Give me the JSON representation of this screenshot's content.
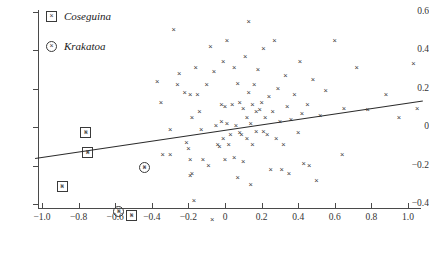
{
  "chart_data": {
    "type": "scatter",
    "title": "",
    "xlabel": "",
    "ylabel": "",
    "xlim": [
      -1.0,
      1.0
    ],
    "ylim": [
      -0.5,
      0.6
    ],
    "grid": false,
    "legend_position": "top-left",
    "xticks": [
      "−1.0",
      "−0.8",
      "−0.6",
      "−0.4",
      "−0.2",
      "0",
      "0.2",
      "0.4",
      "0.6",
      "0.8",
      "1.0"
    ],
    "xtick_values": [
      -1.0,
      -0.8,
      -0.6,
      -0.4,
      -0.2,
      0,
      0.2,
      0.4,
      0.6,
      0.8,
      1.0
    ],
    "yticks": [
      "0.6",
      "0.4",
      "0.2",
      "0",
      "−0.2",
      "−0.4"
    ],
    "ytick_values": [
      0.6,
      0.4,
      0.2,
      0,
      -0.2,
      -0.4
    ],
    "legend": [
      {
        "label": "Coseguina",
        "marker": "boxed-cross"
      },
      {
        "label": "Krakatoa",
        "marker": "circled-cross"
      }
    ],
    "series": [
      {
        "name": "observations",
        "marker": "cross",
        "points": [
          [
            -0.76,
            -0.03
          ],
          [
            -0.75,
            -0.13
          ],
          [
            -0.89,
            -0.31
          ],
          [
            -0.58,
            -0.44
          ],
          [
            -0.51,
            -0.46
          ],
          [
            -0.44,
            -0.21
          ],
          [
            -0.37,
            0.24
          ],
          [
            -0.35,
            0.13
          ],
          [
            -0.34,
            -0.14
          ],
          [
            -0.3,
            -0.14
          ],
          [
            -0.3,
            -0.01
          ],
          [
            -0.28,
            0.51
          ],
          [
            -0.26,
            0.22
          ],
          [
            -0.25,
            0.28
          ],
          [
            -0.22,
            0.18
          ],
          [
            -0.21,
            -0.08
          ],
          [
            -0.2,
            -0.11
          ],
          [
            -0.19,
            0.17
          ],
          [
            -0.19,
            -0.17
          ],
          [
            -0.19,
            -0.25
          ],
          [
            -0.18,
            0.05
          ],
          [
            -0.18,
            -0.24
          ],
          [
            -0.17,
            -0.38
          ],
          [
            -0.16,
            0.31
          ],
          [
            -0.15,
            0.17
          ],
          [
            -0.14,
            0.08
          ],
          [
            -0.13,
            -0.01
          ],
          [
            -0.12,
            -0.17
          ],
          [
            -0.1,
            0.22
          ],
          [
            -0.09,
            -0.2
          ],
          [
            -0.08,
            0.42
          ],
          [
            -0.07,
            -0.48
          ],
          [
            -0.06,
            0.29
          ],
          [
            -0.05,
            0.01
          ],
          [
            -0.04,
            -0.09
          ],
          [
            -0.03,
            -0.1
          ],
          [
            -0.02,
            0.12
          ],
          [
            -0.02,
            0.03
          ],
          [
            -0.01,
            -0.06
          ],
          [
            -0.01,
            0.34
          ],
          [
            0.0,
            0.11
          ],
          [
            0.0,
            -0.17
          ],
          [
            0.01,
            0.02
          ],
          [
            0.01,
            0.45
          ],
          [
            0.02,
            -0.09
          ],
          [
            0.03,
            -0.04
          ],
          [
            0.04,
            0.12
          ],
          [
            0.05,
            0.31
          ],
          [
            0.05,
            -0.16
          ],
          [
            0.06,
            0.01
          ],
          [
            0.07,
            0.23
          ],
          [
            0.07,
            -0.26
          ],
          [
            0.08,
            0.13
          ],
          [
            0.08,
            -0.03
          ],
          [
            0.09,
            -0.04
          ],
          [
            0.1,
            0.1
          ],
          [
            0.1,
            -0.18
          ],
          [
            0.11,
            0.37
          ],
          [
            0.12,
            0.05
          ],
          [
            0.12,
            -0.06
          ],
          [
            0.13,
            0.18
          ],
          [
            0.13,
            0.55
          ],
          [
            0.14,
            0.02
          ],
          [
            0.14,
            -0.3
          ],
          [
            0.15,
            0.12
          ],
          [
            0.15,
            -0.09
          ],
          [
            0.16,
            0.22
          ],
          [
            0.17,
            0.08
          ],
          [
            0.17,
            -0.02
          ],
          [
            0.18,
            0.3
          ],
          [
            0.19,
            0.09
          ],
          [
            0.2,
            0.13
          ],
          [
            0.21,
            -0.02
          ],
          [
            0.21,
            0.41
          ],
          [
            0.22,
            0.05
          ],
          [
            0.23,
            -0.04
          ],
          [
            0.24,
            0.16
          ],
          [
            0.25,
            -0.22
          ],
          [
            0.26,
            0.08
          ],
          [
            0.27,
            0.45
          ],
          [
            0.28,
            -0.06
          ],
          [
            0.29,
            0.2
          ],
          [
            0.3,
            0.03
          ],
          [
            0.31,
            -0.22
          ],
          [
            0.32,
            -0.09
          ],
          [
            0.33,
            0.27
          ],
          [
            0.34,
            0.11
          ],
          [
            0.35,
            -0.24
          ],
          [
            0.36,
            0.04
          ],
          [
            0.38,
            0.17
          ],
          [
            0.4,
            -0.03
          ],
          [
            0.41,
            0.34
          ],
          [
            0.42,
            0.07
          ],
          [
            0.43,
            -0.19
          ],
          [
            0.45,
            0.12
          ],
          [
            0.46,
            -0.2
          ],
          [
            0.48,
            0.25
          ],
          [
            0.5,
            -0.28
          ],
          [
            0.52,
            0.06
          ],
          [
            0.55,
            0.19
          ],
          [
            0.6,
            0.45
          ],
          [
            0.64,
            -0.14
          ],
          [
            0.65,
            0.1
          ],
          [
            0.72,
            0.31
          ],
          [
            0.78,
            0.09
          ],
          [
            0.88,
            0.17
          ],
          [
            0.95,
            0.05
          ],
          [
            1.03,
            0.33
          ],
          [
            1.05,
            0.1
          ]
        ]
      },
      {
        "name": "Coseguina",
        "marker": "boxed-cross",
        "points": [
          [
            -0.76,
            -0.03
          ],
          [
            -0.75,
            -0.13
          ],
          [
            -0.89,
            -0.31
          ],
          [
            -0.51,
            -0.46
          ]
        ]
      },
      {
        "name": "Krakatoa",
        "marker": "circled-cross",
        "points": [
          [
            -0.44,
            -0.21
          ],
          [
            -0.58,
            -0.44
          ]
        ]
      }
    ],
    "fit_line": {
      "x0": -1.04,
      "y0": -0.16,
      "x1": 1.08,
      "y1": 0.14,
      "slope": 0.1415,
      "intercept": -0.013
    }
  }
}
